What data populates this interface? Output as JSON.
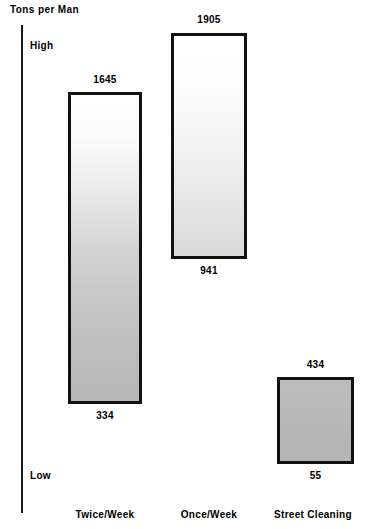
{
  "chart_data": {
    "type": "bar",
    "title": "",
    "ylabel": "Tons per Man",
    "xlabel": "",
    "grid": false,
    "legend": "none",
    "orientation": "vertical",
    "note": "Floating (range) bars: each bar spans from a low value to a high value. Label above bar is the high value, label below bar is the low value.",
    "axis_scale_labels": {
      "top": "High",
      "bottom": "Low"
    },
    "categories": [
      "Twice/Week",
      "Once/Week",
      "Street Cleaning"
    ],
    "high_values": [
      1645,
      1905,
      434
    ],
    "low_values": [
      334,
      941,
      55
    ],
    "bars": [
      {
        "category": "Twice/Week",
        "high": 1645,
        "low": 334,
        "high_label": "1645",
        "low_label": "334",
        "fill": "gradient-white-to-gray"
      },
      {
        "category": "Once/Week",
        "high": 1905,
        "low": 941,
        "high_label": "1905",
        "low_label": "941",
        "fill": "gradient-white-to-lightgray"
      },
      {
        "category": "Street Cleaning",
        "high": 434,
        "low": 55,
        "high_label": "434",
        "low_label": "55",
        "fill": "solid-gray"
      }
    ]
  },
  "axis": {
    "title": "Tons per Man",
    "high_label": "High",
    "low_label": "Low"
  },
  "colors": {
    "axis": "#1a1a1a",
    "bar_outline": "#111111",
    "text": "#000000",
    "background": "#ffffff"
  }
}
